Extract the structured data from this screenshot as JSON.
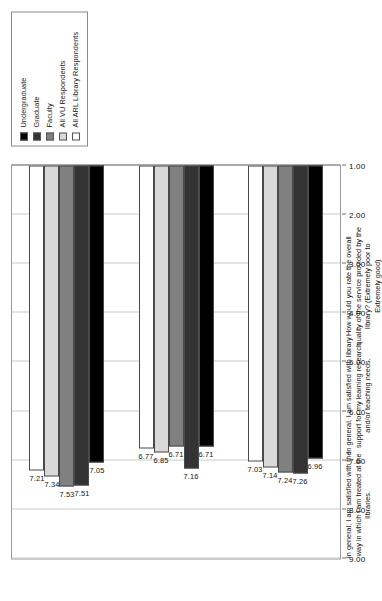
{
  "chart_data": {
    "type": "bar",
    "orientation": "horizontal",
    "title": "",
    "xlabel": "",
    "ylabel": "",
    "xlim": [
      1.0,
      9.0
    ],
    "grid": true,
    "legend_position": "top-right",
    "axis_ticks": [
      "9.00",
      "8.00",
      "7.00",
      "6.00",
      "5.00",
      "4.00",
      "3.00",
      "2.00",
      "1.00"
    ],
    "axis_tick_values": [
      9.0,
      8.0,
      7.0,
      6.0,
      5.0,
      4.0,
      3.0,
      2.0,
      1.0
    ],
    "categories": [
      "In general, I am satisfied with the way in which I am treated at the libraries.",
      "In general, I am satisfied with library support for my learning research and/or teaching needs.",
      "How would you rate the overall quality of the service provided by the library? (Extremely poor to Extremely good)"
    ],
    "series": [
      {
        "name": "Undergraduate",
        "color": "#000000",
        "values": [
          7.05,
          6.71,
          6.96
        ]
      },
      {
        "name": "Graduate",
        "color": "#333333",
        "values": [
          7.51,
          7.16,
          7.26
        ]
      },
      {
        "name": "Faculty",
        "color": "#808080",
        "values": [
          7.53,
          6.71,
          7.24
        ]
      },
      {
        "name": "All VU Respondents",
        "color": "#d9d9d9",
        "values": [
          7.34,
          6.85,
          7.14
        ]
      },
      {
        "name": "All ARL Library Respondents",
        "color": "#ffffff",
        "values": [
          7.21,
          6.77,
          7.03
        ]
      }
    ],
    "data_labels": [
      [
        "7.05",
        "7.51",
        "7.53",
        "7.34",
        "7.21"
      ],
      [
        "6.71",
        "7.16",
        "6.71",
        "6.85",
        "6.77"
      ],
      [
        "6.96",
        "7.26",
        "7.24",
        "7.14",
        "7.03"
      ]
    ]
  },
  "legend": {
    "items": [
      {
        "label": "Undergraduate",
        "color": "#000000"
      },
      {
        "label": "Graduate",
        "color": "#333333"
      },
      {
        "label": "Faculty",
        "color": "#808080"
      },
      {
        "label": "All VU Respondents",
        "color": "#d9d9d9"
      },
      {
        "label": "All ARL Library Respondents",
        "color": "#ffffff"
      }
    ]
  }
}
